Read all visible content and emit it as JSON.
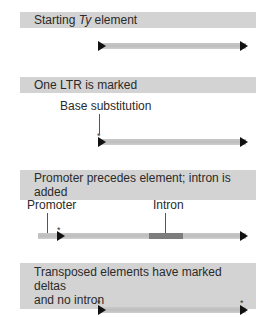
{
  "panels": [
    {
      "title_pre": "Starting ",
      "title_italic": "Ty",
      "title_post": " element"
    },
    {
      "title": "One LTR is marked",
      "label": "Base substitution",
      "marker": "*"
    },
    {
      "title": "Promoter precedes element; intron is added",
      "label_promoter": "Promoter",
      "label_intron": "Intron",
      "marker": "*"
    },
    {
      "title_line1": "Transposed elements have marked deltas",
      "title_line2": "and no intron",
      "marker_left": "*",
      "marker_right": "*"
    }
  ],
  "colors": {
    "header_bg": "#d3d3d3",
    "bar": "#c4c4c4",
    "intron": "#7d7d7d",
    "arrow": "#111111"
  }
}
